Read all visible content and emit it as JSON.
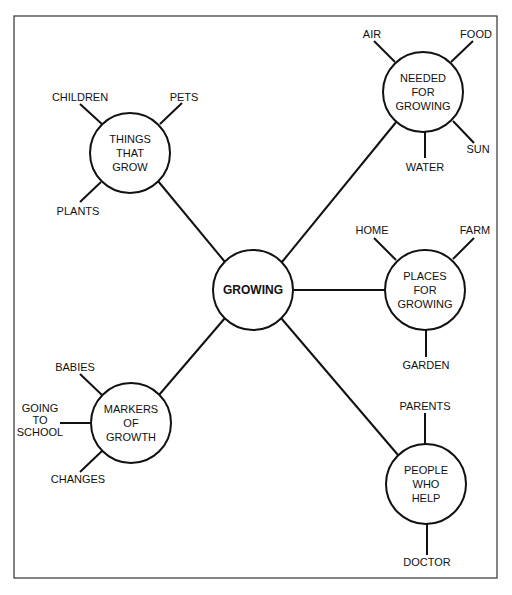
{
  "diagram": {
    "type": "concept-map",
    "colors": {
      "line": "#111111",
      "frame": "#333333",
      "background": "#ffffff"
    },
    "center": {
      "label": "GROWING",
      "x": 253,
      "y": 290,
      "r": 40
    },
    "nodes": [
      {
        "id": "things-that-grow",
        "lines": [
          "THINGS",
          "THAT",
          "GROW"
        ],
        "x": 130,
        "y": 153,
        "r": 40,
        "leaves": [
          {
            "label": "CHILDREN",
            "lx": 80,
            "ly": 101,
            "x1": 80,
            "y1": 104,
            "x2": 103,
            "y2": 125
          },
          {
            "label": "PETS",
            "lx": 184,
            "ly": 101,
            "x1": 182,
            "y1": 103,
            "x2": 160,
            "y2": 124
          },
          {
            "label": "PLANTS",
            "lx": 78,
            "ly": 215,
            "x1": 80,
            "y1": 202,
            "x2": 101,
            "y2": 182
          }
        ]
      },
      {
        "id": "needed-for-growing",
        "lines": [
          "NEEDED",
          "FOR",
          "GROWING"
        ],
        "x": 423,
        "y": 92,
        "r": 40,
        "leaves": [
          {
            "label": "AIR",
            "lx": 372,
            "ly": 38,
            "x1": 374,
            "y1": 41,
            "x2": 395,
            "y2": 62
          },
          {
            "label": "FOOD",
            "lx": 476,
            "ly": 38,
            "x1": 473,
            "y1": 41,
            "x2": 451,
            "y2": 62
          },
          {
            "label": "SUN",
            "lx": 478,
            "ly": 153,
            "x1": 474,
            "y1": 143,
            "x2": 453,
            "y2": 121
          },
          {
            "label": "WATER",
            "lx": 425,
            "ly": 171,
            "x1": 425,
            "y1": 132,
            "x2": 425,
            "y2": 158
          }
        ]
      },
      {
        "id": "places-for-growing",
        "lines": [
          "PLACES",
          "FOR",
          "GROWING"
        ],
        "x": 425,
        "y": 290,
        "r": 40,
        "leaves": [
          {
            "label": "HOME",
            "lx": 372,
            "ly": 234,
            "x1": 374,
            "y1": 238,
            "x2": 396,
            "y2": 260
          },
          {
            "label": "FARM",
            "lx": 475,
            "ly": 234,
            "x1": 474,
            "y1": 238,
            "x2": 453,
            "y2": 259
          },
          {
            "label": "GARDEN",
            "lx": 426,
            "ly": 369,
            "x1": 426,
            "y1": 330,
            "x2": 426,
            "y2": 357
          }
        ]
      },
      {
        "id": "markers-of-growth",
        "lines": [
          "MARKERS",
          "OF",
          "GROWTH"
        ],
        "x": 131,
        "y": 423,
        "r": 40,
        "leaves": [
          {
            "label": "BABIES",
            "lx": 75,
            "ly": 371,
            "x1": 80,
            "y1": 374,
            "x2": 102,
            "y2": 395
          },
          {
            "label": "GOING TO SCHOOL",
            "lines": [
              "GOING",
              "TO",
              "SCHOOL"
            ],
            "lx": 40,
            "ly": 412,
            "x1": 60,
            "y1": 423,
            "x2": 91,
            "y2": 423
          },
          {
            "label": "CHANGES",
            "lx": 78,
            "ly": 483,
            "x1": 80,
            "y1": 472,
            "x2": 102,
            "y2": 451
          }
        ]
      },
      {
        "id": "people-who-help",
        "lines": [
          "PEOPLE",
          "WHO",
          "HELP"
        ],
        "x": 426,
        "y": 484,
        "r": 40,
        "leaves": [
          {
            "label": "PARENTS",
            "lx": 425,
            "ly": 410,
            "x1": 425,
            "y1": 413,
            "x2": 425,
            "y2": 444
          },
          {
            "label": "DOCTOR",
            "lx": 427,
            "ly": 566,
            "x1": 427,
            "y1": 524,
            "x2": 427,
            "y2": 555
          }
        ]
      }
    ]
  }
}
